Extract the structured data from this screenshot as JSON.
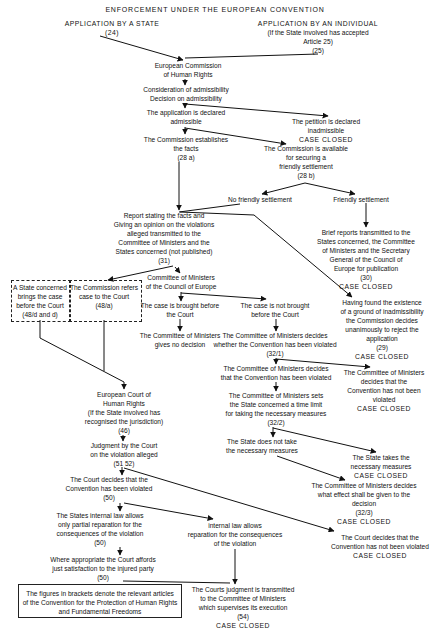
{
  "title": "ENFORCEMENT UNDER THE EUROPEAN CONVENTION",
  "nodes": {
    "app_state": [
      "APPLICATION BY A STATE",
      "(24)"
    ],
    "app_individual": [
      "APPLICATION BY AN INDIVIDUAL",
      "(If the State involved has accepted",
      "Article 25)",
      "(25)"
    ],
    "commission": [
      "European Commission",
      "of Human Rights"
    ],
    "admissibility": [
      "Consideration of admissibility",
      "Decision on admissibility"
    ],
    "declared_admissible": [
      "The application is declared",
      "admissible"
    ],
    "inadmissible": [
      "The petition is declared",
      "inadmissible",
      "CASE CLOSED"
    ],
    "establishes_facts": [
      "The Commission establishes",
      "the facts",
      "(28 a)"
    ],
    "friendly_available": [
      "The Commission is available",
      "for securing a",
      "friendly settlement",
      "(28 b)"
    ],
    "no_friendly": [
      "No friendly settlement"
    ],
    "friendly": [
      "Friendly settlement"
    ],
    "report": [
      "Report stating the facts and",
      "Giving an opinion on the violations",
      "alleged transmitted to the",
      "Committee of Ministers and the",
      "States concerned (not published)",
      "(31)"
    ],
    "brief_reports": [
      "Brief reports transmitted to the",
      "States concerned, the Committee",
      "of Ministers and the Secretary",
      "General of the Council of",
      "Europe for publication",
      "(30)",
      "CASE CLOSED"
    ],
    "state_brings": [
      "A State concerned",
      "brings the case",
      "before the Court",
      "(48/d and d)"
    ],
    "commission_refers": [
      "The Commission refers",
      "case to the Court",
      "(48/a)"
    ],
    "committee_coe": [
      "Committee of Ministers",
      "of the Council of Europe"
    ],
    "reject_unanimous": [
      "Having found the existence",
      "of a ground of inadmissibility",
      "the Commission decides",
      "unanimously to reject the",
      "application",
      "(29)",
      "CASE CLOSED"
    ],
    "case_brought": [
      "The case is brought before",
      "the Court"
    ],
    "case_not_brought": [
      "The case is not brought",
      "before the Court"
    ],
    "cm_no_decision": [
      "The Committee of Ministers",
      "gives no decision"
    ],
    "cm_decides_whether": [
      "The Committee of Ministers decides",
      "whether the Convention has been violated",
      "(32/1)"
    ],
    "cm_violated": [
      "The Committee of Ministers decides",
      "that the Convention has been violated"
    ],
    "cm_not_violated": [
      "The Committee of Ministers",
      "decides that the",
      "Convention has not been",
      "violated",
      "CASE CLOSED"
    ],
    "cm_time_limit": [
      "The Committee of Ministers sets",
      "the State concerned a time limit",
      "for taking the necessary measures",
      "(32/2)"
    ],
    "court": [
      "European Court of",
      "Human Rights",
      "(If the State involved has",
      "recognised the jurisdiction)",
      "(46)"
    ],
    "state_not_take": [
      "The State does not take",
      "the necessary measures"
    ],
    "state_takes": [
      "The State takes the",
      "necessary measures",
      "CASE CLOSED"
    ],
    "judgment": [
      "Judgment by the Court",
      "on the violation alleged",
      "(51 52)"
    ],
    "cm_effect": [
      "The Committee of Ministers decides",
      "what effect shall be given to the",
      "decision",
      "(32/3)",
      "CASE CLOSED"
    ],
    "court_violated": [
      "The Court decides that the",
      "Convention has been violated",
      "(50)"
    ],
    "court_not_violated": [
      "The Court decides that the",
      "Convention has not been violated",
      "CASE CLOSED"
    ],
    "partial_reparation": [
      "The States internal law allows",
      "only partial reparation for the",
      "consequences of the violation",
      "(50)"
    ],
    "full_reparation": [
      "internal law allows",
      "reparation for the consequences",
      "of the violation"
    ],
    "just_satisfaction": [
      "Where appropriate the Court affords",
      "just satisfaction to the injured party",
      "(50)"
    ],
    "judgment_transmitted": [
      "The Courts judgment is transmitted",
      "to the Committee of Ministers",
      "which supervises its execution",
      "(54)",
      "CASE CLOSED"
    ]
  },
  "note": [
    "The figures in brackets denote the relevant articles",
    "of the Convention for the Protection of Human Rights",
    "and Fundamental Freedoms"
  ],
  "colors": {
    "ink": "#111111",
    "background": "#ffffff"
  }
}
